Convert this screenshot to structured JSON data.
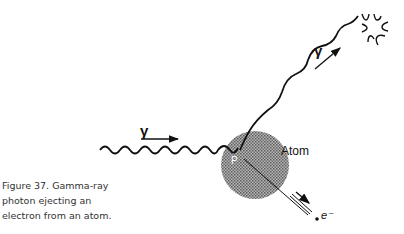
{
  "caption": {
    "lines": [
      "Figure 37. Gamma-ray",
      "photon ejecting an",
      "electron from an atom."
    ]
  },
  "labels": {
    "incoming_photon": "γ",
    "outgoing_photon": "γ",
    "atom": "Atom",
    "interaction_point": "P",
    "electron": "e⁻"
  },
  "colors": {
    "ink": "#111111",
    "atom_fill": "#8a8a8a"
  }
}
